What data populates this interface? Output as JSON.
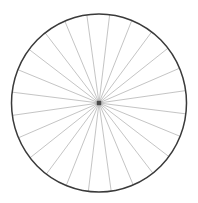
{
  "figure": {
    "title": "Spoked wheel",
    "canvas": {
      "width": 198,
      "height": 203,
      "background_color": "#ffffff"
    }
  },
  "chart_data": {
    "type": "scatter",
    "title": "Spoked wheel",
    "xlabel": "",
    "ylabel": "",
    "grid": false,
    "legend": null,
    "xlim": [
      0,
      198
    ],
    "ylim": [
      0,
      203
    ],
    "rim": {
      "label": "rim",
      "center_x": 99,
      "center_y": 103,
      "radius_x": 87.5,
      "radius_y": 89,
      "stroke_color": "#3a3a3a",
      "stroke_width": 1.5,
      "fill": "none"
    },
    "hub": {
      "label": "hub",
      "center_x": 99,
      "center_y": 103,
      "size": 4.5,
      "color": "#4a4a4a"
    },
    "spokes": {
      "label": "spokes",
      "count": 24,
      "angle_step_degrees": 15,
      "start_angle_degrees": 7,
      "stroke_color": "#b5b5b5",
      "stroke_width": 0.8,
      "angles_degrees": [
        7,
        22,
        37,
        52,
        67,
        82,
        97,
        112,
        127,
        142,
        157,
        172,
        187,
        202,
        217,
        232,
        247,
        262,
        277,
        292,
        307,
        322,
        337,
        352
      ]
    }
  }
}
